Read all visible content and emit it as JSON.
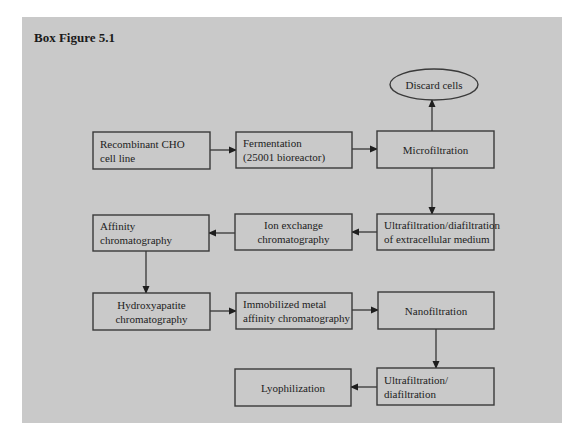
{
  "figure": {
    "title": "Box Figure 5.1",
    "panel_color": "#c9c9c9",
    "border_color": "#3a3a3a"
  },
  "nodes": [
    {
      "id": "discard",
      "shape": "ellipse",
      "label": [
        "Discard cells"
      ],
      "x": 390,
      "y": 69,
      "w": 88,
      "h": 31,
      "align": "center"
    },
    {
      "id": "cho",
      "shape": "rect",
      "label": [
        "Recombinant CHO",
        "cell line"
      ],
      "x": 93,
      "y": 132,
      "w": 117,
      "h": 37,
      "align": "left"
    },
    {
      "id": "ferm",
      "shape": "rect",
      "label": [
        "Fermentation",
        "(25001 bioreactor)"
      ],
      "x": 236,
      "y": 132,
      "w": 116,
      "h": 36,
      "align": "left"
    },
    {
      "id": "micro",
      "shape": "rect",
      "label": [
        "Microfiltration"
      ],
      "x": 377,
      "y": 131,
      "w": 117,
      "h": 37,
      "align": "center"
    },
    {
      "id": "ufdf1",
      "shape": "rect",
      "label": [
        "Ultrafiltration/diafiltration",
        "of extracellular medium"
      ],
      "x": 377,
      "y": 214,
      "w": 117,
      "h": 36,
      "align": "left"
    },
    {
      "id": "ionex",
      "shape": "rect",
      "label": [
        "Ion exchange",
        "chromatography"
      ],
      "x": 235,
      "y": 214,
      "w": 117,
      "h": 36,
      "align": "center"
    },
    {
      "id": "affinity",
      "shape": "rect",
      "label": [
        "Affinity",
        "chromatography"
      ],
      "x": 93,
      "y": 215,
      "w": 116,
      "h": 36,
      "align": "left"
    },
    {
      "id": "hydroxy",
      "shape": "rect",
      "label": [
        "Hydroxyapatite",
        "chromatography"
      ],
      "x": 93,
      "y": 293,
      "w": 117,
      "h": 37,
      "align": "center"
    },
    {
      "id": "imac",
      "shape": "rect",
      "label": [
        "Immobilized metal",
        "affinity chromatography"
      ],
      "x": 236,
      "y": 293,
      "w": 116,
      "h": 36,
      "align": "left"
    },
    {
      "id": "nano",
      "shape": "rect",
      "label": [
        "Nanofiltration"
      ],
      "x": 378,
      "y": 292,
      "w": 116,
      "h": 37,
      "align": "center"
    },
    {
      "id": "ufdf2",
      "shape": "rect",
      "label": [
        "Ultrafiltration/",
        "diafiltration"
      ],
      "x": 377,
      "y": 368,
      "w": 117,
      "h": 37,
      "align": "left"
    },
    {
      "id": "lyo",
      "shape": "rect",
      "label": [
        "Lyophilization"
      ],
      "x": 235,
      "y": 369,
      "w": 116,
      "h": 37,
      "align": "center"
    }
  ],
  "edges": [
    {
      "from": "cho",
      "to": "ferm",
      "points": [
        [
          210,
          150
        ],
        [
          236,
          150
        ]
      ]
    },
    {
      "from": "ferm",
      "to": "micro",
      "points": [
        [
          352,
          149
        ],
        [
          377,
          149
        ]
      ]
    },
    {
      "from": "micro",
      "to": "discard",
      "points": [
        [
          432,
          131
        ],
        [
          432,
          100
        ]
      ]
    },
    {
      "from": "micro",
      "to": "ufdf1",
      "points": [
        [
          432,
          168
        ],
        [
          432,
          214
        ]
      ]
    },
    {
      "from": "ufdf1",
      "to": "ionex",
      "points": [
        [
          377,
          232
        ],
        [
          352,
          232
        ]
      ]
    },
    {
      "from": "ionex",
      "to": "affinity",
      "points": [
        [
          235,
          233
        ],
        [
          209,
          233
        ]
      ]
    },
    {
      "from": "affinity",
      "to": "hydroxy",
      "points": [
        [
          146,
          251
        ],
        [
          146,
          293
        ]
      ]
    },
    {
      "from": "hydroxy",
      "to": "imac",
      "points": [
        [
          210,
          311
        ],
        [
          236,
          311
        ]
      ]
    },
    {
      "from": "imac",
      "to": "nano",
      "points": [
        [
          352,
          310
        ],
        [
          378,
          310
        ]
      ]
    },
    {
      "from": "nano",
      "to": "ufdf2",
      "points": [
        [
          436,
          329
        ],
        [
          436,
          368
        ]
      ]
    },
    {
      "from": "ufdf2",
      "to": "lyo",
      "points": [
        [
          377,
          387
        ],
        [
          351,
          387
        ]
      ]
    }
  ]
}
